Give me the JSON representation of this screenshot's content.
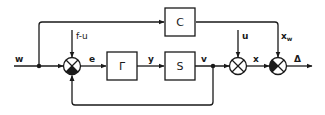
{
  "diagram": {
    "type": "control-block-diagram",
    "line_color": "#1a1a1a",
    "background": "#ffffff",
    "blocks": [
      {
        "id": "gamma",
        "label": "Γ"
      },
      {
        "id": "c",
        "label": "C"
      },
      {
        "id": "s",
        "label": "S"
      }
    ],
    "signals": {
      "w": "w",
      "f_minus_u": "f-u",
      "e": "e",
      "y": "y",
      "v": "v",
      "u": "u",
      "x": "x",
      "xw_base": "x",
      "xw_sub": "w",
      "delta": "Δ"
    },
    "summing_junctions": [
      {
        "id": "sum1",
        "inputs": [
          "w (+)",
          "f-u (+)",
          "v feedback (−)"
        ],
        "output": "e"
      },
      {
        "id": "sum2",
        "inputs": [
          "v (+)",
          "u (+)"
        ],
        "output": "x"
      },
      {
        "id": "sum3",
        "inputs": [
          "x (−)",
          "x_w (+)"
        ],
        "output": "Δ"
      }
    ]
  }
}
